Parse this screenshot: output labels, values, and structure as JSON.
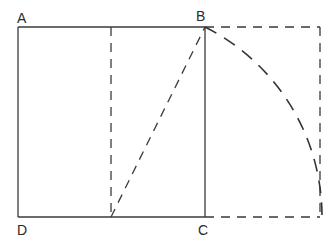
{
  "diagram": {
    "labels": {
      "A": "A",
      "B": "B",
      "C": "C",
      "D": "D"
    },
    "elements": [
      {
        "id": "square-ABCD",
        "style": "solid",
        "description": "Square ABCD"
      },
      {
        "id": "midline",
        "style": "dashed",
        "description": "Vertical line through midpoint of AB and DC"
      },
      {
        "id": "diagonal",
        "style": "dashed",
        "description": "Line from midpoint of DC to B"
      },
      {
        "id": "arc",
        "style": "dashed",
        "description": "Arc centered at midpoint of DC with radius to B, swung down to extension of DC"
      },
      {
        "id": "extension",
        "style": "dashed",
        "description": "Rectangle extension to the right forming golden rectangle"
      }
    ],
    "colors": {
      "stroke": "#3a3a3a",
      "background": "#ffffff"
    }
  }
}
